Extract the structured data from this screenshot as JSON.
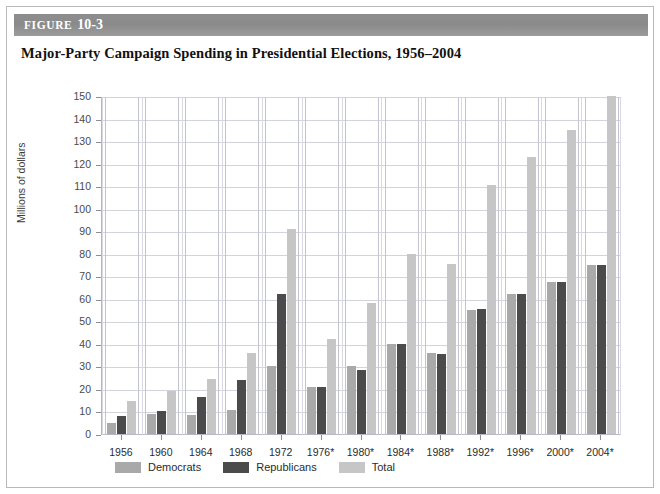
{
  "figure": {
    "header_word": "FIGURE",
    "header_number": "10-3",
    "title": "Major-Party Campaign Spending in Presidential Elections, 1956–2004"
  },
  "chart_data": {
    "type": "bar",
    "title": "Major-Party Campaign Spending in Presidential Elections, 1956–2004",
    "xlabel": "",
    "ylabel": "Millions of dollars",
    "ylim": [
      0,
      150
    ],
    "ytick_step": 10,
    "yticks": [
      0,
      10,
      20,
      30,
      40,
      50,
      60,
      70,
      80,
      90,
      100,
      110,
      120,
      130,
      140,
      150
    ],
    "ytick_labels": [
      "0",
      "10",
      "20",
      "30",
      "40",
      "50",
      "60",
      "70",
      "80",
      "90",
      "100",
      "110",
      "120",
      "130",
      "140",
      "150"
    ],
    "grid": true,
    "legend_position": "bottom-left",
    "categories": [
      "1956",
      "1960",
      "1964",
      "1968",
      "1972",
      "1976*",
      "1980*",
      "1984*",
      "1988*",
      "1992*",
      "1996*",
      "2000*",
      "2004*"
    ],
    "series": [
      {
        "name": "Democrats",
        "color": "#a9a9a9",
        "values": [
          5,
          9,
          8.5,
          10.5,
          30,
          21,
          30,
          40,
          36,
          55,
          62,
          67.5,
          75
        ]
      },
      {
        "name": "Republicans",
        "color": "#4b4b4b",
        "values": [
          8,
          10,
          16.5,
          24,
          62,
          21,
          28.5,
          40,
          35.5,
          55.5,
          62,
          67.5,
          75
        ]
      },
      {
        "name": "Total",
        "color": "#c6c6c6",
        "values": [
          14.5,
          19,
          24.5,
          36,
          91,
          42,
          58,
          80,
          75.5,
          110.5,
          123,
          135,
          150
        ]
      }
    ]
  },
  "colors": {
    "democrats": "#a9a9a9",
    "republicans": "#4b4b4b",
    "total": "#c6c6c6",
    "header_bar": "#8e8e8e",
    "grid": "#d3d3de",
    "axis": "#b6b6c4"
  }
}
